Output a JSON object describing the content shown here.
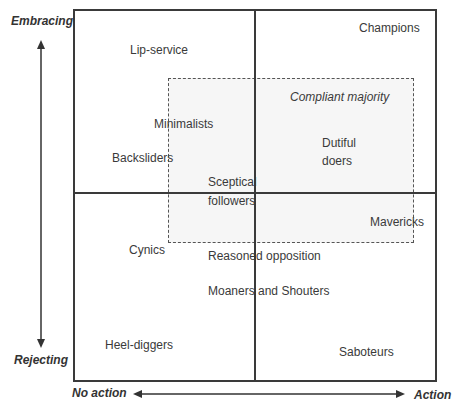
{
  "axes": {
    "y_top": "Embracing",
    "y_bottom": "Rejecting",
    "x_left": "No action",
    "x_right": "Action"
  },
  "group_label": "Compliant majority",
  "items": {
    "lip_service": "Lip-service",
    "champions": "Champions",
    "minimalists": "Minimalists",
    "backsliders": "Backsliders",
    "dutiful_1": "Dutiful",
    "dutiful_2": "doers",
    "sceptical_1": "Sceptical",
    "sceptical_2": "followers",
    "mavericks": "Mavericks",
    "cynics": "Cynics",
    "reasoned": "Reasoned opposition",
    "moaners": "Moaners and Shouters",
    "heel": "Heel-diggers",
    "saboteurs": "Saboteurs"
  }
}
